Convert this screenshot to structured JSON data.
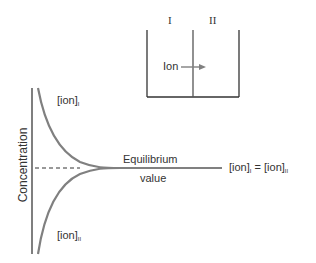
{
  "beaker": {
    "compartment_labels": [
      "I",
      "II"
    ],
    "ion_label": "Ion"
  },
  "graph": {
    "y_axis_label": "Concentration",
    "curve_upper_label": "[ion]",
    "curve_upper_sub": "I",
    "curve_lower_label": "[ion]",
    "curve_lower_sub": "II",
    "equilibrium_line1": "Equilibrium",
    "equilibrium_line2": "value",
    "equality": {
      "left": "[ion]",
      "left_sub": "I",
      "eq": " = ",
      "right": "[ion]",
      "right_sub": "II"
    }
  },
  "colors": {
    "curve": "#808080",
    "lines": "#333333"
  }
}
